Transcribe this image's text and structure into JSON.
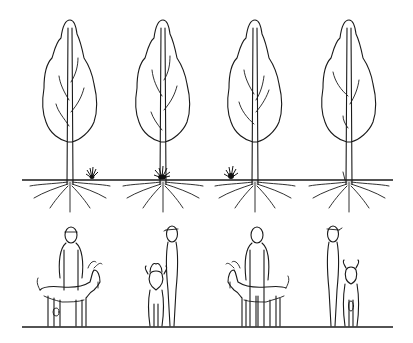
{
  "figure": {
    "background": "#ffffff",
    "ink_color": "#1a1a1a",
    "trees": [
      {
        "id": "tree-1",
        "center_x": 70,
        "grass_tuft": "right"
      },
      {
        "id": "tree-2",
        "center_x": 163,
        "grass_tuft": "at-base"
      },
      {
        "id": "tree-3",
        "center_x": 255,
        "grass_tuft": "left"
      },
      {
        "id": "tree-4",
        "center_x": 349,
        "grass_tuft": "none"
      }
    ],
    "figures": [
      {
        "id": "pair-1",
        "person": "front-view",
        "goat": "side-view-facing-right"
      },
      {
        "id": "pair-2",
        "person": "side-view-with-cap",
        "goat": "front-view"
      },
      {
        "id": "pair-3",
        "person": "front-view",
        "goat": "side-view-facing-left"
      },
      {
        "id": "pair-4",
        "person": "side-view-with-cap",
        "goat": "rear-view"
      }
    ]
  }
}
